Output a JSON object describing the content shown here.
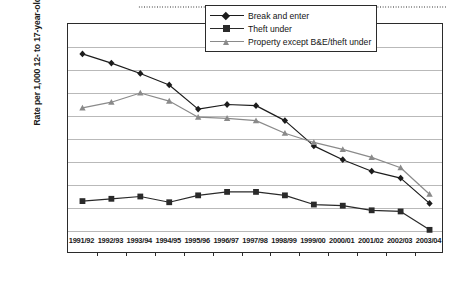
{
  "chart_data": {
    "type": "line",
    "title": "",
    "xlabel": "",
    "ylabel": "Rate per 1,000 12- to 17-year-olds",
    "ylim": [
      0.0,
      2.0
    ],
    "ytick_step": 0.2,
    "ytick_labels": [
      "2.00",
      "1.80",
      "1.60",
      "1.40",
      "1.20",
      "1.00",
      "0.80",
      "0.60",
      "0.40",
      "0.20",
      "0.00"
    ],
    "ytick_values": [
      2.0,
      1.8,
      1.6,
      1.4,
      1.2,
      1.0,
      0.8,
      0.6,
      0.4,
      0.2,
      0.0
    ],
    "grid": true,
    "grid_axis": "y",
    "legend_position": "top-right",
    "categories": [
      "1991/92",
      "1992/93",
      "1993/94",
      "1994/95",
      "1995/96",
      "1996/97",
      "1997/98",
      "1998/99",
      "1999/00",
      "2000/01",
      "2001/02",
      "2002/03",
      "2003/04"
    ],
    "series": [
      {
        "name": "Break and enter",
        "marker": "diamond",
        "color": "#1c1c1c",
        "values": [
          1.74,
          1.66,
          1.57,
          1.47,
          1.26,
          1.3,
          1.29,
          1.16,
          0.94,
          0.82,
          0.72,
          0.66,
          0.44
        ]
      },
      {
        "name": "Theft under",
        "marker": "square",
        "color": "#2a2a2a",
        "values": [
          0.46,
          0.48,
          0.5,
          0.45,
          0.51,
          0.54,
          0.54,
          0.51,
          0.43,
          0.42,
          0.38,
          0.37,
          0.21
        ]
      },
      {
        "name": "Property except B&E/theft under",
        "marker": "triangle",
        "color": "#8a8a8a",
        "values": [
          1.27,
          1.32,
          1.4,
          1.33,
          1.19,
          1.18,
          1.16,
          1.05,
          0.97,
          0.91,
          0.84,
          0.75,
          0.52
        ]
      }
    ]
  },
  "decor": {
    "top_rule": "dotted-rule"
  }
}
